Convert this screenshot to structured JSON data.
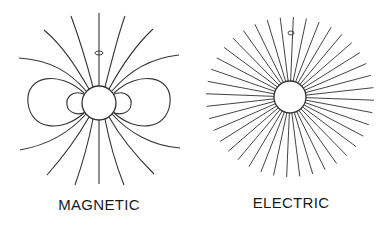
{
  "panels": [
    {
      "id": "magnetic",
      "label": "MAGNETIC",
      "description": "Dipole field lines around a spinning sphere; spin-axis rotation arrow above",
      "sphere": {
        "cx": 99,
        "cy": 103,
        "r": 17
      },
      "rotation_glyph": {
        "cx": 99,
        "cy": 52
      }
    },
    {
      "id": "electric",
      "label": "ELECTRIC",
      "description": "Radial field lines emanating from a charged sphere; rotation arrow above",
      "sphere": {
        "cx": 290,
        "cy": 97,
        "r": 16
      },
      "ray_count": 40,
      "ray_outer_rx": 84,
      "ray_outer_ry": 80,
      "rotation_glyph": {
        "cx": 291,
        "cy": 33
      }
    }
  ],
  "colors": {
    "line": "#333333",
    "background": "#ffffff",
    "text": "#1a1a1a"
  }
}
